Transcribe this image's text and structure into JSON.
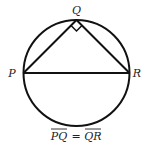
{
  "diagram": {
    "type": "geometry",
    "points": {
      "P": {
        "label": "P"
      },
      "Q": {
        "label": "Q"
      },
      "R": {
        "label": "R"
      }
    },
    "right_angle_at": "Q",
    "caption": {
      "left": "PQ",
      "op": "=",
      "right": "QR"
    },
    "colors": {
      "stroke": "#111111",
      "text": "#222222",
      "background": "#ffffff"
    }
  }
}
